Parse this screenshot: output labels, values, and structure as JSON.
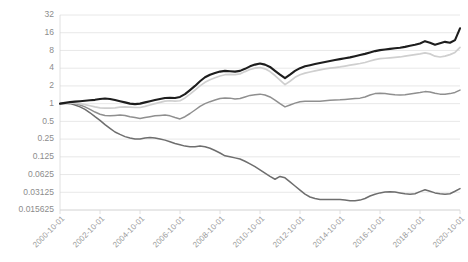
{
  "chart_data": {
    "type": "line",
    "title": "",
    "xlabel": "",
    "ylabel": "",
    "yscale": "log2",
    "ylim": [
      0.015625,
      32
    ],
    "grid": true,
    "legend_position": "top-left-inside",
    "ytick_labels": [
      "32",
      "16",
      "8",
      "4",
      "2",
      "1",
      "0.5",
      "0.25",
      "0.125",
      "0.0625",
      "0.03125",
      "0.015625"
    ],
    "ytick_values": [
      32,
      16,
      8,
      4,
      2,
      1,
      0.5,
      0.25,
      0.125,
      0.0625,
      0.03125,
      0.015625
    ],
    "xtick_labels": [
      "2000-10-01",
      "2002-10-01",
      "2004-10-01",
      "2006-10-01",
      "2008-10-01",
      "2010-10-01",
      "2012-10-01",
      "2014-10-01",
      "2016-10-01",
      "2018-10-01",
      "2020-10-01"
    ],
    "xtick_values": [
      2000.75,
      2002.75,
      2004.75,
      2006.75,
      2008.75,
      2010.75,
      2012.75,
      2014.75,
      2016.75,
      2018.75,
      2020.75
    ],
    "xlim": [
      2000.75,
      2020.75
    ],
    "x": [
      2000.75,
      2001.0,
      2001.25,
      2001.5,
      2001.75,
      2002.0,
      2002.25,
      2002.5,
      2002.75,
      2003.0,
      2003.25,
      2003.5,
      2003.75,
      2004.0,
      2004.25,
      2004.5,
      2004.75,
      2005.0,
      2005.25,
      2005.5,
      2005.75,
      2006.0,
      2006.25,
      2006.5,
      2006.75,
      2007.0,
      2007.25,
      2007.5,
      2007.75,
      2008.0,
      2008.25,
      2008.5,
      2008.75,
      2009.0,
      2009.25,
      2009.5,
      2009.75,
      2010.0,
      2010.25,
      2010.5,
      2010.75,
      2011.0,
      2011.25,
      2011.5,
      2011.75,
      2012.0,
      2012.25,
      2012.5,
      2012.75,
      2013.0,
      2013.25,
      2013.5,
      2013.75,
      2014.0,
      2014.25,
      2014.5,
      2014.75,
      2015.0,
      2015.25,
      2015.5,
      2015.75,
      2016.0,
      2016.25,
      2016.5,
      2016.75,
      2017.0,
      2017.25,
      2017.5,
      2017.75,
      2018.0,
      2018.25,
      2018.5,
      2018.75,
      2019.0,
      2019.25,
      2019.5,
      2019.75,
      2020.0,
      2020.25,
      2020.5,
      2020.75
    ],
    "series": [
      {
        "name": "0",
        "color": "#6e6e6e",
        "width": 1.5,
        "values": [
          1.0,
          1.02,
          1.0,
          0.95,
          0.88,
          0.8,
          0.7,
          0.6,
          0.52,
          0.44,
          0.38,
          0.33,
          0.3,
          0.275,
          0.26,
          0.25,
          0.25,
          0.26,
          0.265,
          0.26,
          0.25,
          0.24,
          0.225,
          0.21,
          0.2,
          0.19,
          0.185,
          0.185,
          0.19,
          0.185,
          0.175,
          0.16,
          0.145,
          0.13,
          0.125,
          0.12,
          0.115,
          0.105,
          0.095,
          0.085,
          0.075,
          0.066,
          0.058,
          0.052,
          0.058,
          0.055,
          0.047,
          0.04,
          0.034,
          0.029,
          0.026,
          0.0245,
          0.0235,
          0.0235,
          0.0235,
          0.0235,
          0.0235,
          0.023,
          0.0225,
          0.0225,
          0.023,
          0.0245,
          0.027,
          0.029,
          0.0305,
          0.0315,
          0.032,
          0.0315,
          0.0305,
          0.0295,
          0.029,
          0.0295,
          0.032,
          0.0345,
          0.0325,
          0.0305,
          0.0295,
          0.029,
          0.0295,
          0.0325,
          0.036
        ]
      },
      {
        "name": "1",
        "color": "#8f8f8f",
        "width": 1.5,
        "values": [
          1.0,
          1.02,
          1.03,
          1.0,
          0.95,
          0.88,
          0.8,
          0.72,
          0.66,
          0.63,
          0.62,
          0.63,
          0.64,
          0.63,
          0.6,
          0.58,
          0.56,
          0.58,
          0.6,
          0.62,
          0.63,
          0.64,
          0.62,
          0.58,
          0.55,
          0.6,
          0.68,
          0.78,
          0.9,
          1.0,
          1.08,
          1.15,
          1.22,
          1.25,
          1.24,
          1.2,
          1.22,
          1.3,
          1.38,
          1.42,
          1.45,
          1.4,
          1.3,
          1.15,
          1.0,
          0.88,
          0.95,
          1.02,
          1.08,
          1.1,
          1.1,
          1.1,
          1.1,
          1.12,
          1.14,
          1.15,
          1.16,
          1.18,
          1.2,
          1.22,
          1.24,
          1.3,
          1.4,
          1.48,
          1.5,
          1.48,
          1.45,
          1.42,
          1.4,
          1.42,
          1.46,
          1.5,
          1.54,
          1.6,
          1.58,
          1.5,
          1.45,
          1.44,
          1.48,
          1.55,
          1.7
        ]
      },
      {
        "name": "2",
        "color": "#cfcfcf",
        "width": 1.7,
        "values": [
          1.0,
          1.02,
          1.03,
          1.02,
          1.0,
          0.96,
          0.92,
          0.88,
          0.85,
          0.84,
          0.84,
          0.85,
          0.87,
          0.88,
          0.87,
          0.86,
          0.86,
          0.9,
          0.95,
          1.0,
          1.05,
          1.1,
          1.12,
          1.1,
          1.12,
          1.25,
          1.45,
          1.7,
          2.0,
          2.3,
          2.55,
          2.75,
          2.95,
          3.1,
          3.15,
          3.1,
          3.2,
          3.5,
          3.8,
          4.0,
          4.1,
          3.9,
          3.5,
          3.0,
          2.5,
          2.1,
          2.4,
          2.8,
          3.1,
          3.3,
          3.45,
          3.6,
          3.75,
          3.9,
          4.0,
          4.1,
          4.2,
          4.35,
          4.5,
          4.65,
          4.8,
          5.0,
          5.3,
          5.6,
          5.8,
          5.9,
          6.0,
          6.1,
          6.2,
          6.4,
          6.6,
          6.8,
          7.0,
          7.3,
          7.0,
          6.4,
          6.2,
          6.4,
          6.8,
          7.4,
          9.0
        ]
      },
      {
        "name": "3",
        "color": "#1d1d1d",
        "width": 2.1,
        "values": [
          1.0,
          1.03,
          1.06,
          1.08,
          1.1,
          1.12,
          1.14,
          1.16,
          1.2,
          1.22,
          1.2,
          1.15,
          1.1,
          1.05,
          1.0,
          0.98,
          1.0,
          1.05,
          1.1,
          1.15,
          1.2,
          1.25,
          1.26,
          1.25,
          1.3,
          1.45,
          1.7,
          2.0,
          2.4,
          2.8,
          3.1,
          3.3,
          3.5,
          3.6,
          3.55,
          3.5,
          3.6,
          3.9,
          4.3,
          4.6,
          4.8,
          4.6,
          4.2,
          3.6,
          3.1,
          2.7,
          3.1,
          3.6,
          4.0,
          4.3,
          4.5,
          4.7,
          4.9,
          5.1,
          5.3,
          5.5,
          5.7,
          5.9,
          6.1,
          6.4,
          6.7,
          7.0,
          7.4,
          7.8,
          8.1,
          8.3,
          8.5,
          8.7,
          8.9,
          9.2,
          9.6,
          10.0,
          10.5,
          11.5,
          10.8,
          10.0,
          10.6,
          11.2,
          10.8,
          12.0,
          19.0
        ]
      }
    ]
  },
  "legend": {
    "entries": [
      {
        "label": "0"
      },
      {
        "label": "1"
      },
      {
        "label": "2"
      },
      {
        "label": "3"
      }
    ]
  }
}
